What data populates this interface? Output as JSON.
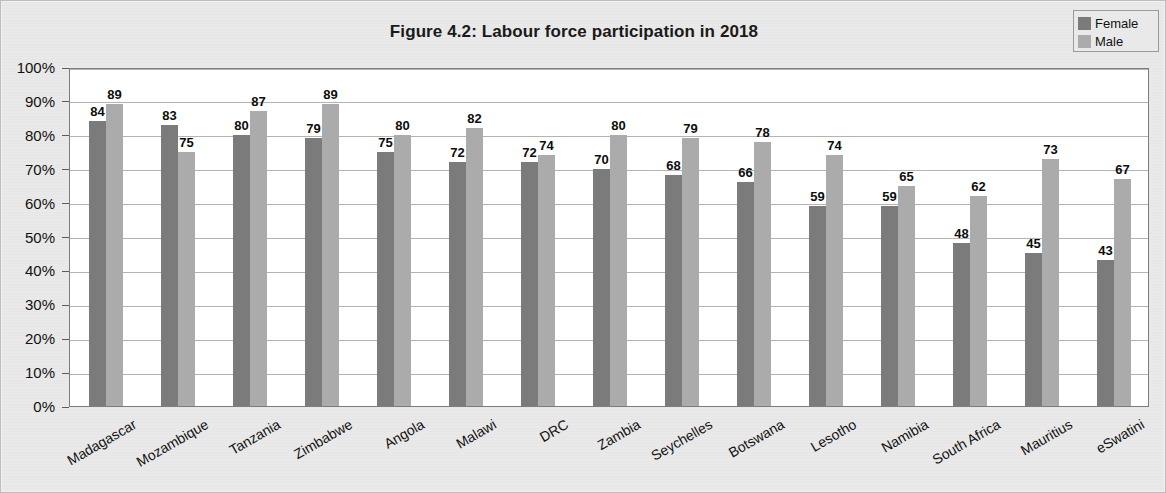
{
  "figure": {
    "title": "Figure 4.2: Labour force participation in 2018"
  },
  "legend": {
    "position": "top-right",
    "entries": [
      {
        "label": "Female",
        "color": "#7b7b7b",
        "swatch_name": "legend-swatch-female"
      },
      {
        "label": "Male",
        "color": "#ababab",
        "swatch_name": "legend-swatch-male"
      }
    ]
  },
  "axes": {
    "y_ticks": [
      "0%",
      "10%",
      "20%",
      "30%",
      "40%",
      "50%",
      "60%",
      "70%",
      "80%",
      "90%",
      "100%"
    ],
    "y_min": 0,
    "y_max": 100,
    "y_step": 10
  },
  "chart_data": {
    "type": "bar",
    "title": "Figure 4.2: Labour force participation in 2018",
    "xlabel": "",
    "ylabel": "",
    "ylim": [
      0,
      100
    ],
    "ytick_labels": [
      "0%",
      "10%",
      "20%",
      "30%",
      "40%",
      "50%",
      "60%",
      "70%",
      "80%",
      "90%",
      "100%"
    ],
    "grid": true,
    "legend_position": "top-right",
    "orientation": "vertical",
    "grouping": "grouped",
    "value_label_format": "integer",
    "categories": [
      "Madagascar",
      "Mozambique",
      "Tanzania",
      "Zimbabwe",
      "Angola",
      "Malawi",
      "DRC",
      "Zambia",
      "Seychelles",
      "Botswana",
      "Lesotho",
      "Namibia",
      "South Africa",
      "Mauritius",
      "eSwatini"
    ],
    "series": [
      {
        "name": "Female",
        "color": "#7b7b7b",
        "values": [
          84,
          83,
          80,
          79,
          75,
          72,
          72,
          70,
          68,
          66,
          59,
          59,
          48,
          45,
          43
        ]
      },
      {
        "name": "Male",
        "color": "#ababab",
        "values": [
          89,
          75,
          87,
          89,
          80,
          82,
          74,
          80,
          79,
          78,
          74,
          65,
          62,
          73,
          67
        ]
      }
    ]
  }
}
